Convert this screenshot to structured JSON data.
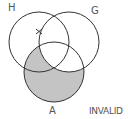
{
  "diagram": {
    "type": "venn-3-set",
    "sets": [
      {
        "label": "H",
        "cx": 39,
        "cy": 42,
        "r": 30
      },
      {
        "label": "G",
        "cx": 69,
        "cy": 42,
        "r": 30
      },
      {
        "label": "A",
        "cx": 54,
        "cy": 72,
        "r": 30
      }
    ],
    "shaded_region": "A minus G",
    "shade_color": "#c4c4c4",
    "stroke_color": "#333333",
    "mark": {
      "symbol": "x",
      "region": "H and G boundary, outside A",
      "x": 39,
      "y": 31
    },
    "verdict": "INVALID"
  },
  "labels": {
    "h": "H",
    "g": "G",
    "a": "A",
    "verdict": "INVALID"
  }
}
